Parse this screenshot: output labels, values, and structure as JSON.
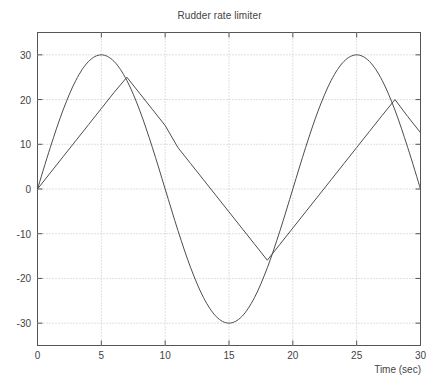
{
  "chart_data": {
    "type": "line",
    "title": "Rudder rate limiter",
    "xlabel": "Time (sec)",
    "ylabel": "",
    "xlim": [
      0,
      30
    ],
    "ylim": [
      -35,
      35
    ],
    "xticks": [
      0,
      5,
      10,
      15,
      20,
      25,
      30
    ],
    "xtick_labels": [
      "0",
      "5",
      "10",
      "15",
      "20",
      "25",
      "30"
    ],
    "yticks": [
      -30,
      -20,
      -10,
      0,
      10,
      20,
      30
    ],
    "ytick_labels": [
      "-30",
      "-20",
      "-10",
      "0",
      "10",
      "20",
      "30"
    ],
    "grid": true,
    "grid_style": "dotted",
    "legend": null,
    "line_color": "#4d4d4d",
    "axis_color": "#555555",
    "grid_color": "#c8c8c8",
    "background_color": "#ffffff",
    "series": [
      {
        "name": "Rudder command (sine)",
        "description": "Unlimited sinusoidal command, amplitude 30 deg, period 20 sec",
        "x": [
          0,
          1,
          2,
          3,
          4,
          5,
          6,
          7,
          8,
          9,
          10,
          11,
          12,
          13,
          14,
          15,
          16,
          17,
          18,
          19,
          20,
          21,
          22,
          23,
          24,
          25,
          26,
          27,
          28,
          29,
          30
        ],
        "values": [
          0,
          9.27,
          17.63,
          24.27,
          28.53,
          30,
          28.53,
          24.27,
          17.63,
          9.27,
          0,
          -9.27,
          -17.63,
          -24.27,
          -28.53,
          -30,
          -28.53,
          -24.27,
          -17.63,
          -9.27,
          0,
          9.27,
          17.63,
          24.27,
          28.53,
          30,
          28.53,
          24.27,
          17.63,
          9.27,
          0
        ]
      },
      {
        "name": "Rate limited rudder",
        "description": "Output of rate limiter, slope limit approximately 3.6 deg/sec",
        "x": [
          0,
          1,
          2,
          3,
          4,
          5,
          6,
          7,
          8,
          9,
          10,
          11,
          12,
          13,
          14,
          15,
          16,
          17,
          18,
          19,
          20,
          21,
          22,
          23,
          24,
          25,
          26,
          27,
          28,
          29,
          30
        ],
        "values": [
          0,
          3.6,
          7.2,
          10.8,
          14.4,
          18.0,
          21.6,
          25.0,
          21.4,
          17.8,
          14.2,
          9.27,
          5.67,
          2.07,
          -1.53,
          -5.13,
          -8.73,
          -12.33,
          -15.93,
          -12.33,
          -8.73,
          -5.13,
          -1.53,
          2.07,
          5.67,
          9.27,
          12.87,
          16.47,
          20.0,
          16.2,
          12.6
        ]
      }
    ],
    "annotations": {
      "sine_peak_1": {
        "x": 5,
        "y": 30
      },
      "sine_trough": {
        "x": 15,
        "y": -30
      },
      "sine_peak_2": {
        "x": 25,
        "y": 30
      },
      "limited_peak_1": {
        "x": 7,
        "y": 25
      },
      "limited_trough": {
        "x": 18,
        "y": -17
      },
      "limited_peak_2": {
        "x": 28,
        "y": 20
      },
      "limited_end": {
        "x": 30,
        "y": 12
      }
    }
  }
}
